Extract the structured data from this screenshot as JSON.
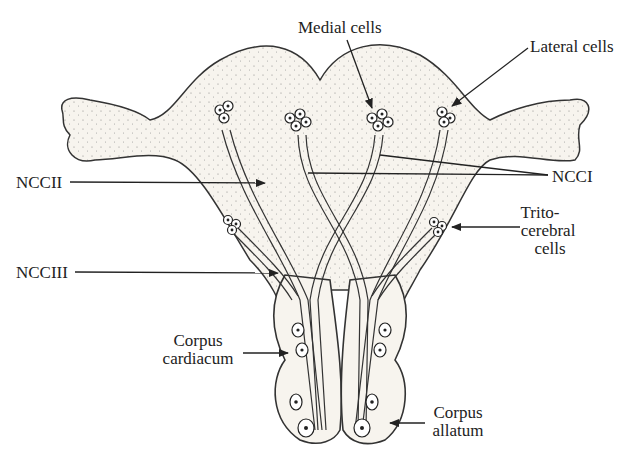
{
  "figure": {
    "labels": {
      "medial_cells": "Medial cells",
      "lateral_cells": "Lateral cells",
      "nccii": "NCCII",
      "ncci": "NCCI",
      "ncciii": "NCCIII",
      "trito_line1": "Trito-",
      "trito_line2": "cerebral",
      "trito_line3": "cells",
      "cc_line1": "Corpus",
      "cc_line2": "cardiacum",
      "ca_line1": "Corpus",
      "ca_line2": "allatum"
    },
    "colors": {
      "ink": "#222222",
      "tissue": "#f7f4ee",
      "background": "#ffffff"
    }
  }
}
